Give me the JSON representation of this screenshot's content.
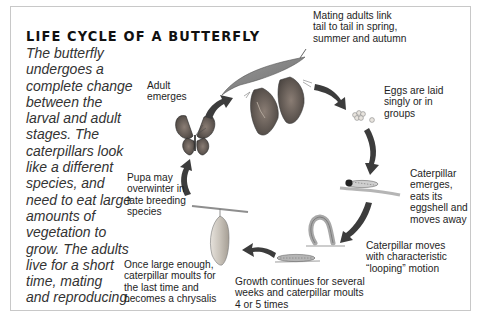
{
  "diagram": {
    "title": "LIFE CYCLE OF A BUTTERFLY",
    "intro": "The butterfly undergoes a complete change between the larval and adult stages. The caterpillars look like a different species, and need to eat large amounts of vegetation to grow. The adults live for a short time, mating and reproducing.",
    "intro_lines": [
      "The butterfly",
      "undergoes a",
      "complete change",
      "between the",
      "larval and adult",
      "stages. The",
      "caterpillars look",
      "like a different",
      "species, and",
      "need to eat large",
      "amounts of",
      "vegetation to",
      "grow. The adults",
      "live for a short",
      "time, mating",
      "and reproducing."
    ],
    "stages": [
      {
        "id": "mating",
        "lines": [
          "Mating adults link",
          "tail to tail in spring,",
          "summer and autumn"
        ]
      },
      {
        "id": "eggs",
        "lines": [
          "Eggs are laid",
          "singly or in",
          "groups"
        ]
      },
      {
        "id": "caterpillar-emerges",
        "lines": [
          "Caterpillar",
          "emerges,",
          "eats its",
          "eggshell and",
          "moves away"
        ]
      },
      {
        "id": "looping",
        "lines": [
          "Caterpillar moves",
          "with characteristic",
          "“looping” motion"
        ]
      },
      {
        "id": "growth",
        "lines": [
          "Growth continues for several",
          "weeks and caterpillar moults",
          "4 or 5 times"
        ]
      },
      {
        "id": "chrysalis",
        "lines": [
          "Once large enough,",
          "caterpillar moults for",
          "the last time and",
          "becomes a chrysalis"
        ]
      },
      {
        "id": "pupa",
        "lines": [
          "Pupa may",
          "overwinter in",
          "late breeding",
          "species"
        ]
      },
      {
        "id": "adult",
        "lines": [
          "Adult",
          "emerges"
        ]
      }
    ],
    "colors": {
      "frame_border": "#c8c8c8",
      "title": "#111111",
      "intro_text": "#333333",
      "label_text": "#1e1e1e",
      "arrow": "#3c3c3c"
    }
  }
}
